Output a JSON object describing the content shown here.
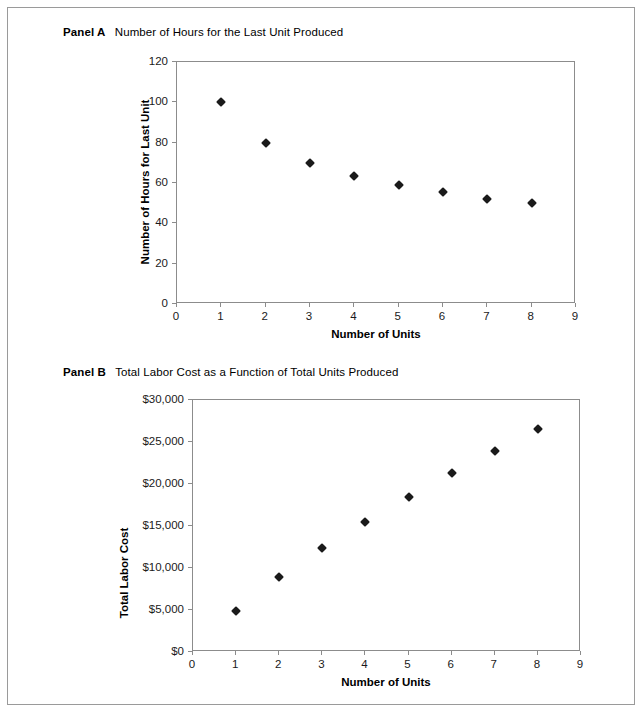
{
  "figure": {
    "border_color": "#9a9a9a",
    "marker_color": "#1a1a1a",
    "axis_color": "#8c8c8c"
  },
  "panel_a": {
    "caption_tag": "Panel A",
    "caption_text": "Number of Hours for the Last Unit Produced",
    "chart_data": {
      "type": "scatter",
      "title": "Number of Hours for the Last Unit Produced",
      "xlabel": "Number of Units",
      "ylabel": "Number of Hours for Last Unit",
      "xlim": [
        0,
        9
      ],
      "ylim": [
        0,
        120
      ],
      "grid": false,
      "legend": "none",
      "xticks": [
        "0",
        "1",
        "2",
        "3",
        "4",
        "5",
        "6",
        "7",
        "8",
        "9"
      ],
      "xtick_values": [
        0,
        1,
        2,
        3,
        4,
        5,
        6,
        7,
        8,
        9
      ],
      "yticks": [
        "0",
        "20",
        "40",
        "60",
        "80",
        "100",
        "120"
      ],
      "ytick_values": [
        0,
        20,
        40,
        60,
        80,
        100,
        120
      ],
      "x": [
        1,
        2,
        3,
        4,
        5,
        6,
        7,
        8
      ],
      "values": [
        100,
        80,
        70,
        63.5,
        59,
        55.5,
        52,
        50
      ]
    }
  },
  "panel_b": {
    "caption_tag": "Panel B",
    "caption_text": "Total Labor Cost as a Function of Total Units Produced",
    "chart_data": {
      "type": "scatter",
      "title": "Total Labor Cost as a Function of Total Units Produced",
      "xlabel": "Number of Units",
      "ylabel": "Total Labor Cost",
      "xlim": [
        0,
        9
      ],
      "ylim": [
        0,
        30000
      ],
      "grid": false,
      "legend": "none",
      "xticks": [
        "0",
        "1",
        "2",
        "3",
        "4",
        "5",
        "6",
        "7",
        "8",
        "9"
      ],
      "xtick_values": [
        0,
        1,
        2,
        3,
        4,
        5,
        6,
        7,
        8,
        9
      ],
      "yticks": [
        "$0",
        "$5,000",
        "$10,000",
        "$15,000",
        "$20,000",
        "$25,000",
        "$30,000"
      ],
      "ytick_values": [
        0,
        5000,
        10000,
        15000,
        20000,
        25000,
        30000
      ],
      "x": [
        1,
        2,
        3,
        4,
        5,
        6,
        7,
        8
      ],
      "values": [
        4900,
        8900,
        12400,
        15500,
        18500,
        21300,
        23900,
        26500
      ]
    }
  }
}
